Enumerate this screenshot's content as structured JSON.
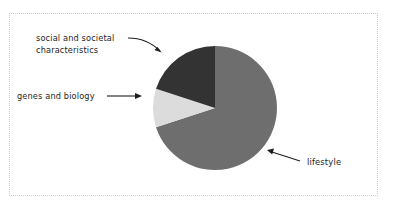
{
  "figure": {
    "frame_style": "dotted",
    "frame_color": "#c9cdd4",
    "background": "#ffffff"
  },
  "chart_data": {
    "type": "pie",
    "title": "",
    "subtitle": "",
    "xlabel": "",
    "ylabel": "",
    "grid": false,
    "legend_position": "none",
    "labels_position": "callout-annotations",
    "start_angle_deg": 0,
    "direction": "clockwise",
    "categories": [
      "lifestyle",
      "social and societal characteristics",
      "genes and biology"
    ],
    "values": [
      70,
      20,
      10
    ],
    "unit": "percent",
    "colors": [
      "#6e6e6e",
      "#333333",
      "#dcdcdc"
    ],
    "slices": [
      {
        "label": "lifestyle",
        "value": 70,
        "color": "#6e6e6e",
        "start_angle_deg": 0,
        "end_angle_deg": 252,
        "annotation": "lifestyle"
      },
      {
        "label": "genes and biology",
        "value": 10,
        "color": "#dcdcdc",
        "start_angle_deg": 252,
        "end_angle_deg": 288,
        "annotation": "genes and biology"
      },
      {
        "label": "social and societal characteristics",
        "value": 20,
        "color": "#333333",
        "start_angle_deg": 288,
        "end_angle_deg": 360,
        "annotation": "social and societal characteristics"
      }
    ],
    "annotations": [
      {
        "name": "social-societal-label",
        "line1": "social and societal",
        "line2": "characteristics",
        "arrow": "curved",
        "arrow_direction": "down-right",
        "points_to": "social and societal characteristics"
      },
      {
        "name": "genes-biology-label",
        "line1": "genes and biology",
        "line2": "",
        "arrow": "straight",
        "arrow_direction": "right",
        "points_to": "genes and biology"
      },
      {
        "name": "lifestyle-label",
        "line1": "lifestyle",
        "line2": "",
        "arrow": "straight",
        "arrow_direction": "up-left",
        "points_to": "lifestyle"
      }
    ]
  },
  "labels": {
    "social_line1": "social and societal",
    "social_line2": "characteristics",
    "genes": "genes and biology",
    "lifestyle": "lifestyle"
  }
}
